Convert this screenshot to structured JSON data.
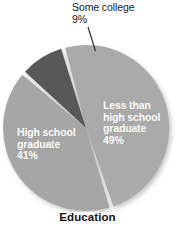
{
  "chart_data": {
    "type": "pie",
    "title": "Education",
    "xlabel": "",
    "ylabel": "",
    "legend_position": "none",
    "grid": false,
    "categories": [
      "Less than high school graduate",
      "High school graduate",
      "Some college"
    ],
    "values": [
      49,
      41,
      9
    ],
    "unit": "%",
    "slices": [
      {
        "label": "Less than high school graduate",
        "label_line1": "Less than",
        "label_line2": "high school",
        "label_line3": "graduate",
        "value": 49,
        "value_text": "49%",
        "color": "#aaaaaa",
        "label_placement": "inside",
        "label_color": "#ffffff"
      },
      {
        "label": "High school graduate",
        "label_line1": "High school",
        "label_line2": "graduate",
        "value": 41,
        "value_text": "41%",
        "color": "#a6a6a6",
        "label_placement": "inside",
        "label_color": "#ffffff"
      },
      {
        "label": "Some college",
        "label_line1": "Some college",
        "value": 9,
        "value_text": "9%",
        "color": "#585858",
        "label_placement": "callout",
        "label_color": "#1a1a1a"
      }
    ],
    "annotations": [
      {
        "name": "leader-line",
        "from": "Some college label",
        "to": "dark wedge"
      }
    ],
    "style": {
      "background": "#ffffff",
      "separator_color": "#ffffff",
      "shadow": true,
      "start_angle_deg": -16
    }
  },
  "callout": {
    "name": "Some college",
    "line1": "Some college",
    "percent": "9%"
  },
  "slice_right": {
    "line1": "Less than",
    "line2": "high school",
    "line3": "graduate",
    "percent": "49%"
  },
  "slice_left": {
    "line1": "High school",
    "line2": "graduate",
    "percent": "41%"
  },
  "title": {
    "text": "Education"
  }
}
